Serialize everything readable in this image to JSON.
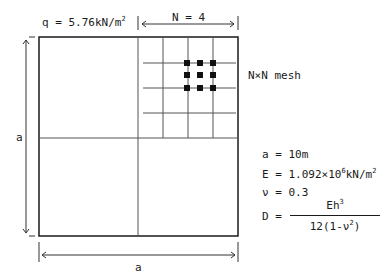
{
  "load_label": {
    "prefix": "q = 5.76kN/m",
    "sup": "2"
  },
  "mesh_count_label": "N = 4",
  "mesh_label": "N×N mesh",
  "side_label_left": "a",
  "side_label_bottom": "a",
  "params": {
    "a": "a = 10m",
    "E_prefix": "E = 1.092×10",
    "E_sup": "6",
    "E_suffix": "kN/m",
    "E_suffix_sup": "2",
    "nu": "ν = 0.3",
    "D_lhs": "D =",
    "D_num_prefix": "Eh",
    "D_num_sup": "3",
    "D_den_prefix": "12(1-ν",
    "D_den_sup": "2",
    "D_den_suffix": ")"
  },
  "colors": {
    "line": "#1a1a1a",
    "grid": "#555555"
  }
}
